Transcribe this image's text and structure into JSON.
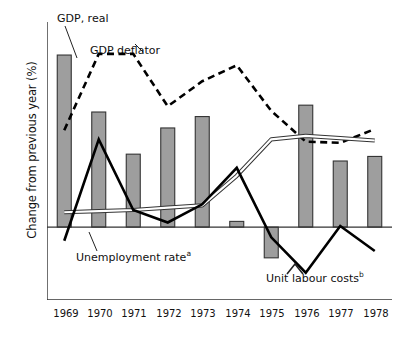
{
  "chart_data": {
    "type": "bar",
    "title": "",
    "subtitle": "",
    "xlabel": "",
    "ylabel": "Change from previous year (%)",
    "categories": [
      "1969",
      "1970",
      "1971",
      "1972",
      "1973",
      "1974",
      "1975",
      "1976",
      "1977",
      "1978"
    ],
    "ylim": [
      -3.2,
      9.0
    ],
    "yticks": [
      "+8",
      "+6",
      "+4",
      "+2",
      "0",
      "–2"
    ],
    "ytick_values": [
      8,
      6,
      4,
      2,
      0,
      -2
    ],
    "grid": false,
    "legend": "inline-annotations",
    "series": [
      {
        "name": "GDP, real",
        "type": "bar",
        "color": "#9e9e9e",
        "edge_color": "#333333",
        "values": [
          7.55,
          5.05,
          3.2,
          4.35,
          4.85,
          0.25,
          -1.35,
          5.35,
          2.9,
          3.1
        ]
      },
      {
        "name": "GDP deflator",
        "type": "line",
        "style": "dashed",
        "color": "#000000",
        "values": [
          4.25,
          7.6,
          7.6,
          5.3,
          6.4,
          7.1,
          5.1,
          3.75,
          3.7,
          4.3
        ]
      },
      {
        "name": "Unemployment rate",
        "footnote": "a",
        "type": "line",
        "style": "double-thin",
        "color": "#ffffff",
        "edge_color": "#333333",
        "values": [
          0.65,
          0.7,
          0.75,
          0.85,
          0.95,
          2.25,
          3.85,
          4.0,
          3.9,
          3.8
        ]
      },
      {
        "name": "Unit labour costs",
        "footnote": "b",
        "type": "line",
        "style": "solid-thick",
        "color": "#000000",
        "values": [
          -0.6,
          3.85,
          0.75,
          0.2,
          1.0,
          2.6,
          -0.45,
          -2.0,
          0.05,
          -1.05
        ]
      }
    ],
    "annotations": [
      {
        "name": "gdp-real-label",
        "text": "GDP, real",
        "footnote": ""
      },
      {
        "name": "gdp-deflator-label",
        "text": "GDP deflator",
        "footnote": ""
      },
      {
        "name": "unemployment-rate-label",
        "text": "Unemployment rate",
        "footnote": "a"
      },
      {
        "name": "unit-labour-costs-label",
        "text": "Unit labour costs",
        "footnote": "b"
      }
    ]
  }
}
